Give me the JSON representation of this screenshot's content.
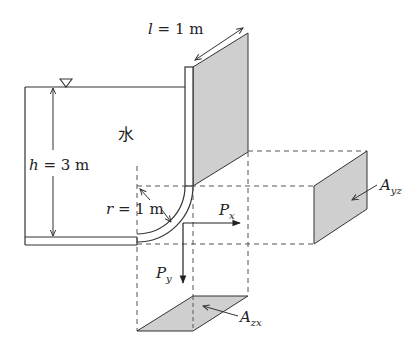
{
  "labels": {
    "length": {
      "var": "l",
      "eq": " = 1 m"
    },
    "height": {
      "var": "h",
      "eq": " = 3 m"
    },
    "radius": {
      "var": "r",
      "eq": " = 1 m"
    },
    "water": "水",
    "force_x": {
      "main": "P",
      "sub": "x"
    },
    "force_y": {
      "main": "P",
      "sub": "y"
    },
    "area_yz": {
      "main": "A",
      "sub": "yz"
    },
    "area_zx": {
      "main": "A",
      "sub": "zx"
    }
  },
  "symbols": {
    "water_surface": "free-surface-triangle"
  },
  "colors": {
    "line": "#333333",
    "shade": "#cfcfcf",
    "dash": "#555555"
  }
}
